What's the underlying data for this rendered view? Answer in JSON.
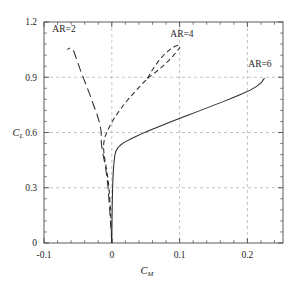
{
  "chart_data": {
    "type": "line",
    "title": "",
    "xlabel": "C_M",
    "ylabel": "C_L",
    "xlabel_base": "C",
    "xlabel_sub": "M",
    "ylabel_base": "C",
    "ylabel_sub": "L",
    "xlim": [
      -0.1,
      0.2525
    ],
    "ylim": [
      0,
      1.2
    ],
    "grid": true,
    "legend_position": "inline-annotations",
    "xticks": [
      -0.1,
      0,
      0.1,
      0.2
    ],
    "xticklabels": [
      "-0.1",
      "0",
      "0.1",
      "0.2"
    ],
    "yticks": [
      0,
      0.3,
      0.6,
      0.9,
      1.2
    ],
    "yticklabels": [
      "0",
      "0.3",
      "0.6",
      "0.9",
      "1.2"
    ],
    "x_minor_step": 0.02,
    "y_minor_step": 0.06,
    "annotations": [
      {
        "text": "AR=2",
        "x": -0.0705,
        "y": 1.148
      },
      {
        "text": "AR=4",
        "x": 0.1035,
        "y": 1.118
      },
      {
        "text": "AR=6",
        "x": 0.2185,
        "y": 0.953
      }
    ],
    "series": [
      {
        "name": "AR=2",
        "style": "long-dash",
        "points": [
          [
            0.0,
            0.0
          ],
          [
            -0.0012,
            0.075
          ],
          [
            -0.0025,
            0.15
          ],
          [
            -0.004,
            0.225
          ],
          [
            -0.0055,
            0.3
          ],
          [
            -0.0072,
            0.355
          ],
          [
            -0.0092,
            0.41
          ],
          [
            -0.0115,
            0.455
          ],
          [
            -0.0138,
            0.5
          ],
          [
            -0.0152,
            0.535
          ],
          [
            -0.0158,
            0.565
          ],
          [
            -0.0155,
            0.6
          ],
          [
            -0.0175,
            0.645
          ],
          [
            -0.0215,
            0.695
          ],
          [
            -0.0265,
            0.745
          ],
          [
            -0.0318,
            0.8
          ],
          [
            -0.0372,
            0.852
          ],
          [
            -0.0425,
            0.902
          ],
          [
            -0.0472,
            0.948
          ],
          [
            -0.0512,
            0.99
          ],
          [
            -0.0545,
            1.025
          ],
          [
            -0.0568,
            1.048
          ],
          [
            -0.0592,
            1.058
          ],
          [
            -0.0625,
            1.058
          ],
          [
            -0.0655,
            1.05
          ]
        ]
      },
      {
        "name": "AR=4",
        "style": "short-dash",
        "points": [
          [
            0.0,
            0.0
          ],
          [
            -0.0008,
            0.08
          ],
          [
            -0.0018,
            0.165
          ],
          [
            -0.003,
            0.245
          ],
          [
            -0.0042,
            0.3
          ],
          [
            -0.0058,
            0.352
          ],
          [
            -0.0078,
            0.4
          ],
          [
            -0.0098,
            0.445
          ],
          [
            -0.0115,
            0.485
          ],
          [
            -0.0122,
            0.515
          ],
          [
            -0.0118,
            0.545
          ],
          [
            -0.0098,
            0.578
          ],
          [
            -0.0062,
            0.612
          ],
          [
            -0.0012,
            0.648
          ],
          [
            0.0048,
            0.685
          ],
          [
            0.0118,
            0.722
          ],
          [
            0.0192,
            0.758
          ],
          [
            0.0272,
            0.793
          ],
          [
            0.0355,
            0.827
          ],
          [
            0.0442,
            0.861
          ],
          [
            0.0528,
            0.894
          ]
        ]
      },
      {
        "name": "AR=4-branch-upper",
        "style": "short-dash",
        "points": [
          [
            0.0528,
            0.894
          ],
          [
            0.0578,
            0.928
          ],
          [
            0.0638,
            0.962
          ],
          [
            0.0705,
            0.995
          ],
          [
            0.0778,
            1.025
          ],
          [
            0.0855,
            1.05
          ],
          [
            0.0932,
            1.068
          ],
          [
            0.0985,
            1.075
          ]
        ]
      },
      {
        "name": "AR=4-branch-lower",
        "style": "short-dash",
        "points": [
          [
            0.0528,
            0.894
          ],
          [
            0.0605,
            0.915
          ],
          [
            0.0682,
            0.938
          ],
          [
            0.0758,
            0.962
          ],
          [
            0.0832,
            0.988
          ],
          [
            0.0902,
            1.015
          ],
          [
            0.0962,
            1.042
          ],
          [
            0.1008,
            1.062
          ]
        ]
      },
      {
        "name": "AR=6",
        "style": "solid",
        "points": [
          [
            0.0,
            0.0
          ],
          [
            0.0002,
            0.09
          ],
          [
            0.0005,
            0.18
          ],
          [
            0.001,
            0.27
          ],
          [
            0.0016,
            0.345
          ],
          [
            0.0024,
            0.4
          ],
          [
            0.0034,
            0.445
          ],
          [
            0.0046,
            0.478
          ],
          [
            0.0062,
            0.5
          ],
          [
            0.0085,
            0.515
          ],
          [
            0.0118,
            0.528
          ],
          [
            0.0162,
            0.541
          ],
          [
            0.0218,
            0.553
          ],
          [
            0.0285,
            0.566
          ],
          [
            0.0362,
            0.58
          ],
          [
            0.0448,
            0.594
          ],
          [
            0.0542,
            0.609
          ],
          [
            0.0645,
            0.625
          ],
          [
            0.0755,
            0.641
          ],
          [
            0.0872,
            0.658
          ],
          [
            0.0995,
            0.676
          ],
          [
            0.1122,
            0.694
          ],
          [
            0.1252,
            0.712
          ],
          [
            0.1385,
            0.731
          ],
          [
            0.1518,
            0.75
          ],
          [
            0.1652,
            0.769
          ],
          [
            0.1785,
            0.789
          ],
          [
            0.1915,
            0.809
          ],
          [
            0.2042,
            0.83
          ],
          [
            0.2142,
            0.852
          ],
          [
            0.2212,
            0.874
          ],
          [
            0.2252,
            0.895
          ]
        ]
      }
    ]
  }
}
